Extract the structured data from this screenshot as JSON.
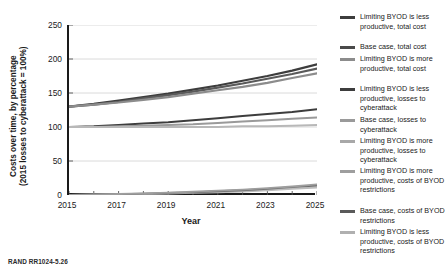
{
  "figure": {
    "source_note": "RAND RR1024-5.26",
    "xlabel": "Year",
    "ylabel_line1": "Costs over time, by percentage",
    "ylabel_line2": "(2015 losses to cyberattack = 100%)"
  },
  "chart_data": {
    "type": "line",
    "title": "",
    "xlabel": "Year",
    "ylabel": "Costs over time, by percentage (2015 losses to cyberattack = 100%)",
    "xlim": [
      2015,
      2025
    ],
    "ylim": [
      0,
      250
    ],
    "xticks": [
      2015,
      2017,
      2019,
      2021,
      2023,
      2025
    ],
    "xticks_minor": [
      2016,
      2018,
      2020,
      2022,
      2024
    ],
    "yticks": [
      0,
      50,
      100,
      150,
      200,
      250
    ],
    "grid": "horizontal",
    "legend_position": "right",
    "x": [
      2015,
      2016,
      2017,
      2018,
      2019,
      2020,
      2021,
      2022,
      2023,
      2024,
      2025
    ],
    "series": [
      {
        "name": "Limiting BYOD is less productive, total cost",
        "color": "#3d3d3d",
        "width": 2.2,
        "values": [
          130,
          134,
          139,
          144,
          149,
          155,
          161,
          168,
          175,
          183,
          192
        ]
      },
      {
        "name": "Base case, total cost",
        "color": "#5a5a5a",
        "width": 2.2,
        "values": [
          130,
          133,
          137,
          142,
          147,
          152,
          158,
          164,
          171,
          178,
          186
        ]
      },
      {
        "name": "Limiting BYOD is more productive, total cost",
        "color": "#8c8c8c",
        "width": 2.2,
        "values": [
          130,
          133,
          136,
          140,
          144,
          149,
          154,
          159,
          165,
          172,
          179
        ]
      },
      {
        "name": "Limiting BYOD is less productive, losses to cyberattack",
        "color": "#3d3d3d",
        "width": 2.0,
        "values": [
          100,
          101,
          103,
          105,
          107,
          110,
          113,
          116,
          119,
          122,
          126
        ]
      },
      {
        "name": "Base case, losses to cyberattack",
        "color": "#9a9a9a",
        "width": 2.0,
        "values": [
          100,
          100,
          101,
          102,
          103,
          104,
          106,
          108,
          110,
          112,
          114
        ]
      },
      {
        "name": "Limiting BYOD is more productive, losses to cyberattack",
        "color": "#b8b8b8",
        "width": 2.0,
        "values": [
          100,
          100,
          100,
          100,
          100,
          100,
          100,
          101,
          101,
          102,
          103
        ]
      },
      {
        "name": "Limiting BYOD is more productive, costs of BYOD restrictions",
        "color": "#bcbcbc",
        "width": 1.8,
        "values": [
          0,
          0.5,
          1,
          1.5,
          2,
          3,
          4,
          5,
          7,
          9,
          11
        ]
      },
      {
        "name": "Base case, costs of BYOD restrictions",
        "color": "#6b6b6b",
        "width": 1.8,
        "values": [
          0,
          0.6,
          1.2,
          2,
          3,
          4,
          5.5,
          7,
          9,
          11.5,
          14
        ]
      },
      {
        "name": "Limiting BYOD is less productive, costs of BYOD restrictions",
        "color": "#9e9e9e",
        "width": 1.8,
        "values": [
          0,
          0.7,
          1.5,
          2.4,
          3.5,
          4.8,
          6.3,
          8,
          10,
          12.5,
          15.5
        ]
      }
    ]
  },
  "legend": {
    "items": [
      {
        "label": "Limiting BYOD is less productive, total cost",
        "color": "#3d3d3d",
        "top": 0
      },
      {
        "label": "Base case, total cost",
        "color": "#4a4a4a",
        "top": 30
      },
      {
        "label": "Limiting BYOD is more productive, total cost",
        "color": "#8c8c8c",
        "top": 42
      },
      {
        "label": "Limiting BYOD is less productive, losses to cyberattack",
        "color": "#3d3d3d",
        "top": 72
      },
      {
        "label": "Base case, losses to cyberattack",
        "color": "#9a9a9a",
        "top": 103
      },
      {
        "label": "Limiting BYOD is more productive, losses to cyberattack",
        "color": "#a8a8a8",
        "top": 124
      },
      {
        "label": "Limiting BYOD is more productive, costs of BYOD restrictions",
        "color": "#9e9e9e",
        "top": 154
      },
      {
        "label": "Base case, costs of BYOD restrictions",
        "color": "#5a5a5a",
        "top": 194
      },
      {
        "label": "Limiting BYOD is less productive, costs of BYOD restrictions",
        "color": "#b0b0b0",
        "top": 215
      }
    ]
  }
}
